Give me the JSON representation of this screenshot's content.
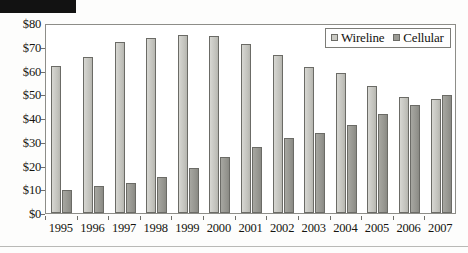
{
  "redaction": {
    "present": true
  },
  "legend": {
    "position": "top-right-inside",
    "entries": [
      {
        "label": "Wireline",
        "swatch": "wireline",
        "color": "#c9c9c3"
      },
      {
        "label": "Cellular",
        "swatch": "cellular",
        "color": "#9a9a94"
      }
    ]
  },
  "axes": {
    "y_ticks": [
      "$0",
      "$10",
      "$20",
      "$30",
      "$40",
      "$50",
      "$60",
      "$70",
      "$80"
    ],
    "y_values": [
      0,
      10,
      20,
      30,
      40,
      50,
      60,
      70,
      80
    ],
    "x_ticks": [
      "1995",
      "1996",
      "1997",
      "1998",
      "1999",
      "2000",
      "2001",
      "2002",
      "2003",
      "2004",
      "2005",
      "2006",
      "2007"
    ]
  },
  "chart_data": {
    "type": "bar",
    "title": "",
    "xlabel": "",
    "ylabel": "",
    "ylim": [
      0,
      80
    ],
    "ytick_step": 10,
    "grid": false,
    "legend_position": "upper right",
    "categories": [
      "1995",
      "1996",
      "1997",
      "1998",
      "1999",
      "2000",
      "2001",
      "2002",
      "2003",
      "2004",
      "2005",
      "2006",
      "2007"
    ],
    "series": [
      {
        "name": "Wireline",
        "color": "#c9c9c3",
        "values": [
          62,
          65.5,
          72,
          73.5,
          75,
          74.5,
          71,
          66.5,
          61.5,
          59,
          53.5,
          49,
          48
        ]
      },
      {
        "name": "Cellular",
        "color": "#9a9a94",
        "values": [
          9.5,
          11.5,
          12.5,
          15,
          19,
          23.5,
          28,
          31.5,
          33.5,
          37,
          41.5,
          45.5,
          49.5
        ]
      }
    ]
  }
}
